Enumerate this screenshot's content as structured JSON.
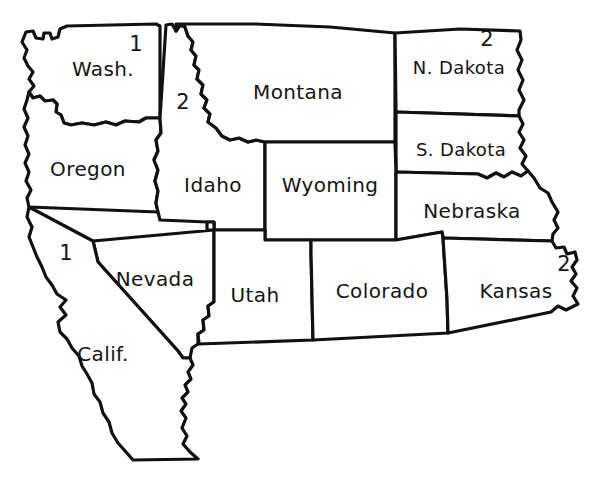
{
  "map": {
    "title": "Western United States outline map with state labels and region numbers",
    "background_color": "#ffffff",
    "outline_color": "#111111",
    "label_color": "#141414",
    "states": [
      {
        "id": "washington",
        "label": "Wash.",
        "label_x": 103,
        "label_y": 70,
        "path": "M 26 32 L 33 31 L 36 38 L 43 39 L 44 33 L 50 33 L 52 39 L 58 37 L 60 29 L 67 26 L 156 24 L 160 26 L 160 118 L 146 118 L 139 122 L 125 121 L 116 125 L 106 122 L 94 125 L 82 123 L 71 125 L 64 123 L 61 115 L 56 112 L 57 104 L 53 100 L 45 101 L 40 96 L 33 98 L 29 92 L 34 86 L 29 79 L 33 72 L 28 66 L 24 58 L 27 50 L 22 42 Z"
      },
      {
        "id": "oregon",
        "label": "Oregon",
        "label_x": 88,
        "label_y": 170,
        "path": "M 29 92 L 33 98 L 40 96 L 45 101 L 53 100 L 57 104 L 56 112 L 61 115 L 64 123 L 71 125 L 82 123 L 94 125 L 106 122 L 116 125 L 125 121 L 139 122 L 146 118 L 160 118 L 161 133 L 156 140 L 158 151 L 154 160 L 158 170 L 155 181 L 158 191 L 156 203 L 158 212 L 29 207 L 27 198 L 31 190 L 26 181 L 29 172 L 25 163 L 29 154 L 25 145 L 28 136 L 24 127 L 28 118 L 24 109 L 27 100 Z"
      },
      {
        "id": "idaho",
        "label": "Idaho",
        "label_x": 213,
        "label_y": 186,
        "path": "M 166 25 L 172 24 L 176 31 L 180 25 L 185 27 L 188 36 L 193 42 L 191 50 L 196 56 L 194 65 L 199 70 L 197 79 L 203 85 L 201 94 L 207 100 L 204 108 L 210 114 L 208 122 L 216 128 L 222 136 L 230 140 L 239 138 L 248 142 L 256 140 L 265 142 L 265 230 L 214 230 L 214 222 L 207 222 L 160 220 L 158 212 L 156 203 L 158 191 L 155 181 L 158 170 L 154 160 L 158 151 L 156 140 L 161 133 L 160 118 Z"
      },
      {
        "id": "montana",
        "label": "Montana",
        "label_x": 298,
        "label_y": 93,
        "path": "M 176 31 L 180 25 L 185 27 L 188 36 L 193 42 L 191 50 L 196 56 L 194 65 L 199 70 L 197 79 L 203 85 L 201 94 L 207 100 L 204 108 L 210 114 L 208 122 L 216 128 L 222 136 L 230 140 L 239 138 L 248 142 L 256 140 L 265 142 L 395 142 L 395 33 L 330 27 L 255 24 L 196 24 L 176 24 Z"
      },
      {
        "id": "north_dakota",
        "label": "N. Dakota",
        "label_x": 459,
        "label_y": 69,
        "path": "M 395 33 L 460 29 L 520 31 L 521 40 L 517 50 L 522 60 L 518 70 L 523 80 L 519 90 L 524 100 L 519 110 L 519 116 L 396 112 Z"
      },
      {
        "id": "south_dakota",
        "label": "S. Dakota",
        "label_x": 461,
        "label_y": 151,
        "path": "M 396 112 L 519 116 L 523 124 L 519 132 L 524 140 L 520 148 L 526 156 L 522 164 L 528 171 L 521 176 L 512 172 L 504 177 L 496 173 L 487 178 L 478 174 L 396 172 Z"
      },
      {
        "id": "wyoming",
        "label": "Wyoming",
        "label_x": 330,
        "label_y": 186,
        "path": "M 265 142 L 395 142 L 396 172 L 396 240 L 265 240 Z"
      },
      {
        "id": "nebraska",
        "label": "Nebraska",
        "label_x": 472,
        "label_y": 212,
        "path": "M 396 172 L 478 174 L 487 178 L 496 173 L 504 177 L 512 172 L 521 176 L 528 171 L 534 178 L 540 188 L 548 193 L 552 202 L 558 212 L 554 220 L 558 228 L 553 234 L 552 241 L 443 238 L 442 232 L 396 240 Z"
      },
      {
        "id": "nevada",
        "label": "Nevada",
        "label_x": 155,
        "label_y": 280,
        "path": "M 93 241 L 214 230 L 214 222 L 207 222 L 207 230 L 214 230 L 214 302 L 208 306 L 209 316 L 203 320 L 204 330 L 198 334 L 198 344 L 192 348 L 190 358 L 183 358 L 178 351 L 98 262 Z"
      },
      {
        "id": "california",
        "label": "Calif.",
        "label_x": 103,
        "label_y": 355,
        "path": "M 29 207 L 93 241 L 98 262 L 178 351 L 183 358 L 190 358 L 193 365 L 188 372 L 191 379 L 185 385 L 188 392 L 182 398 L 186 404 L 181 411 L 186 418 L 182 428 L 187 436 L 183 444 L 190 452 L 198 459 L 133 460 L 126 452 L 118 443 L 112 433 L 109 422 L 103 413 L 100 402 L 94 394 L 92 383 L 87 374 L 82 366 L 79 356 L 72 348 L 67 339 L 60 332 L 58 322 L 66 315 L 60 307 L 66 300 L 57 294 L 52 285 L 46 277 L 42 267 L 37 257 L 33 247 L 29 237 L 32 227 L 27 217 Z"
      },
      {
        "id": "utah",
        "label": "Utah",
        "label_x": 255,
        "label_y": 296,
        "path": "M 214 230 L 265 230 L 265 240 L 311 240 L 311 253 L 313 340 L 199 344 L 198 334 L 204 330 L 203 320 L 209 316 L 208 306 L 214 302 Z"
      },
      {
        "id": "colorado",
        "label": "Colorado",
        "label_x": 382,
        "label_y": 292,
        "path": "M 311 240 L 396 240 L 442 232 L 443 238 L 447 299 L 448 333 L 313 340 L 311 253 Z"
      },
      {
        "id": "kansas",
        "label": "Kansas",
        "label_x": 516,
        "label_y": 292,
        "path": "M 443 238 L 552 241 L 556 248 L 564 247 L 567 254 L 575 252 L 577 260 L 572 267 L 576 274 L 571 281 L 577 288 L 573 296 L 578 304 L 566 310 L 558 306 L 551 312 L 448 333 L 447 299 Z"
      }
    ],
    "region_numbers": [
      {
        "id": "washington-number",
        "value": "1",
        "x": 136,
        "y": 45
      },
      {
        "id": "idaho-number",
        "value": "2",
        "x": 183,
        "y": 103
      },
      {
        "id": "north-dakota-number",
        "value": "2",
        "x": 487,
        "y": 40
      },
      {
        "id": "california-number",
        "value": "1",
        "x": 66,
        "y": 254
      },
      {
        "id": "kansas-number",
        "value": "2",
        "x": 564,
        "y": 265
      }
    ]
  }
}
